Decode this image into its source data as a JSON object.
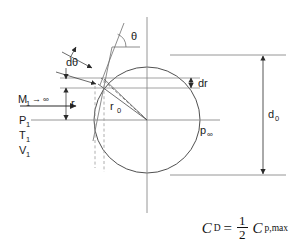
{
  "figure": {
    "colors": {
      "ink": "#1a1a1a",
      "line": "#6f6f6f",
      "thin": "#8a8a8a",
      "dashed": "#9a9a9a",
      "body": "#3c3c3c"
    },
    "geometry": {
      "circle_center_x": 147,
      "circle_center_y": 120,
      "circle_radius": 53,
      "axis_y": 120,
      "vertical_axis_x": 147
    }
  },
  "labels": {
    "mach": "M",
    "mach_sub": "1",
    "mach_arrow": "→",
    "mach_infinity": "∞",
    "pressure_1": "P",
    "pressure_1_sub": "1",
    "temperature_1": "T",
    "temperature_1_sub": "1",
    "velocity_1": "V",
    "velocity_1_sub": "1",
    "theta": "θ",
    "d_theta": "dθ",
    "dr": "dr",
    "r": "r",
    "r_zero": "r",
    "r_zero_sub": "0",
    "p_infinity": "p",
    "p_infinity_sub": "∞",
    "d_zero": "d",
    "d_zero_sub": "0"
  },
  "formula": {
    "lhs": "C",
    "lhs_sub": "D",
    "equals": "=",
    "numerator": "1",
    "denominator": "2",
    "rhs": "C",
    "rhs_sub": "p,max"
  }
}
